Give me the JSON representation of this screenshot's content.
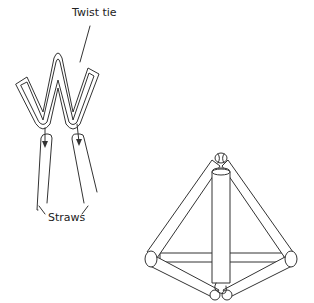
{
  "diagram": {
    "labels": {
      "twist_tie": "Twist tie",
      "straws": "Straws"
    },
    "parts": [
      {
        "name": "twist-tie",
        "shape": "W-shaped folded wire"
      },
      {
        "name": "straws",
        "count": 2,
        "note": "tie ends inserted into straw ends (arrows)"
      },
      {
        "name": "tetrahedron",
        "note": "assembled straw tetrahedron joined at corners with twist ties"
      }
    ],
    "colors": {
      "stroke": "#333333",
      "background": "#ffffff"
    }
  }
}
